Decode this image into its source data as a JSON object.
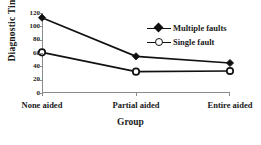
{
  "chart_data": {
    "type": "line",
    "title": "",
    "xlabel": "Group",
    "ylabel": "Diagnostic Time",
    "categories": [
      "None aided",
      "Partial aided",
      "Entire aided"
    ],
    "ylim": [
      0,
      120
    ],
    "yticks": [
      0,
      20,
      40,
      60,
      80,
      100,
      120
    ],
    "ytick_labels": [
      "0",
      "20",
      "40",
      "60",
      "80",
      "100",
      "120"
    ],
    "grid": false,
    "legend_position": "upper right",
    "series": [
      {
        "name": "Multiple faults",
        "marker": "filled-diamond",
        "color": "#111111",
        "values": [
          113,
          55,
          45
        ]
      },
      {
        "name": "Single fault",
        "marker": "open-circle",
        "color": "#111111",
        "values": [
          61,
          32,
          33
        ]
      }
    ]
  },
  "legend": {
    "items": [
      {
        "label": "Multiple faults",
        "marker": "filled-diamond"
      },
      {
        "label": "Single fault",
        "marker": "open-circle"
      }
    ]
  },
  "axes": {
    "y_title": "Diagnostic Time",
    "x_title": "Group",
    "y_tick_labels": [
      "120",
      "100",
      "80",
      "60",
      "40",
      "20",
      "0"
    ],
    "x_tick_labels": [
      "None aided",
      "Partial aided",
      "Entire aided"
    ]
  },
  "colors": {
    "line": "#111111",
    "axis": "#8a8a8a",
    "text": "#1a1a1a",
    "background": "#ffffff"
  }
}
